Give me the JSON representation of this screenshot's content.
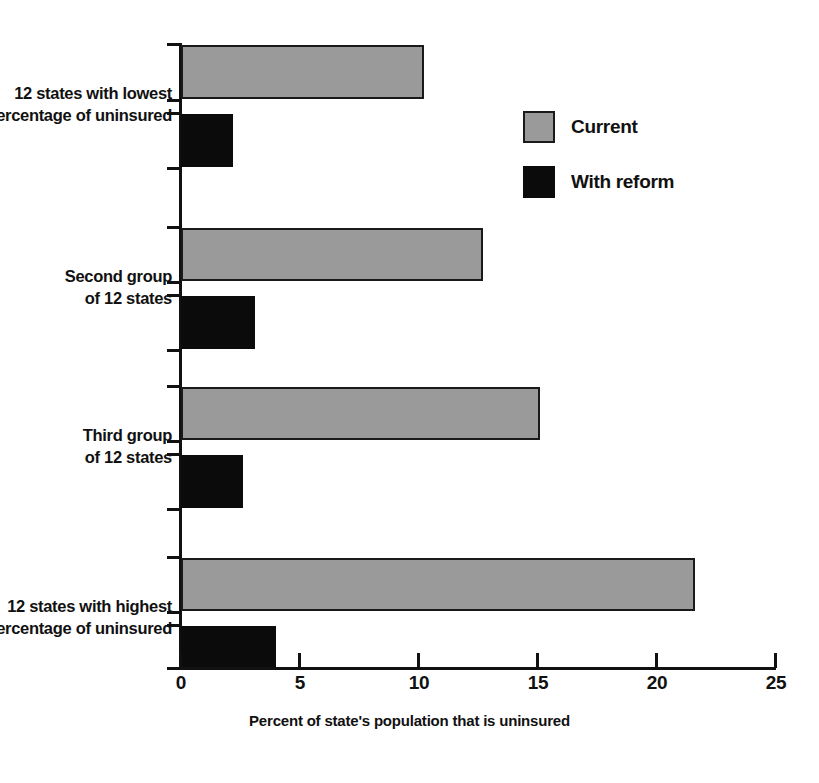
{
  "chart_data": {
    "type": "bar",
    "orientation": "horizontal",
    "title": "",
    "xlabel": "Percent of state's population that is uninsured",
    "ylabel": "",
    "xlim": [
      0,
      25
    ],
    "xticks": [
      0,
      5,
      10,
      15,
      20,
      25
    ],
    "xtick_labels": [
      "0",
      "5",
      "10",
      "15",
      "20",
      "25"
    ],
    "grid": false,
    "legend_position": "upper right",
    "categories": [
      "12 states with lowest percentage of uninsured",
      "Second group of 12 states",
      "Third group of 12 states",
      "12 states with highest percentage of uninsured"
    ],
    "category_lines": [
      [
        "12 states with lowest",
        "percentage of uninsured"
      ],
      [
        "Second group",
        "of 12 states"
      ],
      [
        "Third group",
        "of 12 states"
      ],
      [
        "12 states with highest",
        "percentage of uninsured"
      ]
    ],
    "series": [
      {
        "name": "Current",
        "color": "#9a9a9a",
        "values": [
          10.2,
          12.7,
          15.1,
          21.6
        ]
      },
      {
        "name": "With reform",
        "color": "#0b0b0b",
        "values": [
          2.2,
          3.1,
          2.6,
          4.0
        ]
      }
    ]
  },
  "legend": {
    "items": [
      {
        "label": "Current",
        "color": "#9a9a9a"
      },
      {
        "label": "With reform",
        "color": "#0b0b0b"
      }
    ]
  },
  "axis": {
    "x_title": "Percent of state's population that is uninsured",
    "tick_labels": [
      "0",
      "5",
      "10",
      "15",
      "20",
      "25"
    ]
  },
  "colors": {
    "current": "#9a9a9a",
    "reform": "#0b0b0b",
    "axis": "#111111",
    "background": "#ffffff"
  }
}
